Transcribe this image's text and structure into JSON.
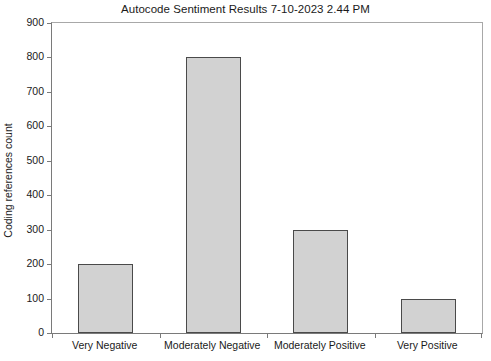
{
  "chart_data": {
    "type": "bar",
    "title": "Autocode Sentiment Results 7-10-2023 2.44 PM",
    "xlabel": "",
    "ylabel": "Coding references count",
    "categories": [
      "Very Negative",
      "Moderately Negative",
      "Moderately Positive",
      "Very Positive"
    ],
    "values": [
      200,
      800,
      300,
      100
    ],
    "ylim": [
      0,
      900
    ],
    "ytick_values": [
      0,
      100,
      200,
      300,
      400,
      500,
      600,
      700,
      800,
      900
    ],
    "ytick_labels": [
      "0",
      "100",
      "200",
      "300",
      "400",
      "500",
      "600",
      "700",
      "800",
      "900"
    ],
    "grid": false,
    "legend": "none",
    "bar_fill_color": "#d2d2d2",
    "bar_edge_color": "#4a4a4a",
    "axis_color": "#7a7a7a",
    "background_color": "#ffffff"
  }
}
